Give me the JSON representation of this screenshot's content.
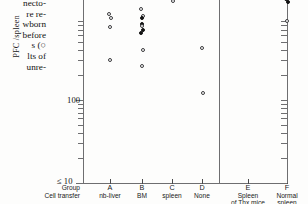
{
  "figure": {
    "caption_fragment_lines": [
      "necto-",
      "re re-",
      "wborn",
      "before",
      "s  (○",
      "lts of",
      "unre-"
    ],
    "y_axis": {
      "label": "PFC /spleen",
      "scale": "log",
      "tick_labels": [
        {
          "text": "100",
          "value": 100
        },
        {
          "text": "10",
          "value": 10
        }
      ],
      "floor_label": "≤ 10"
    },
    "x_axis": {
      "row1_label": "Group",
      "row2_label": "Cell transfer",
      "groups": [
        {
          "letter": "A",
          "name": "nb-liver",
          "sub": ""
        },
        {
          "letter": "B",
          "name": "BM",
          "sub": ""
        },
        {
          "letter": "C",
          "name": "spleen",
          "sub": ""
        },
        {
          "letter": "D",
          "name": "None",
          "sub": ""
        },
        {
          "letter": "E",
          "name": "Spleen",
          "sub": "of Thx mice"
        },
        {
          "letter": "F",
          "name": "Normal",
          "sub": "spleen"
        }
      ]
    },
    "colors": {
      "axis": "#6e6e70",
      "marker_open_stroke": "#3b3b3d",
      "marker_filled": "#141414",
      "background": "#fdfdfc"
    }
  },
  "chart_data": {
    "type": "scatter",
    "title": "",
    "xlabel": "Group / Cell transfer",
    "ylabel": "PFC /spleen",
    "yscale": "log",
    "ylim": [
      10,
      4000
    ],
    "grid": false,
    "legend": [
      "open circle = unresponsive / control",
      "filled circle = responsive"
    ],
    "categories": [
      "A nb-liver",
      "B BM",
      "C spleen",
      "D None",
      "E Spleen of Thx mice",
      "F Normal spleen"
    ],
    "series": [
      {
        "name": "A nb-liver",
        "x": 1,
        "points": [
          {
            "y": 2400,
            "marker": "open"
          },
          {
            "y": 2250,
            "marker": "open"
          },
          {
            "y": 1100,
            "marker": "open"
          },
          {
            "y": 980,
            "marker": "open"
          },
          {
            "y": 760,
            "marker": "open"
          },
          {
            "y": 300,
            "marker": "open"
          }
        ]
      },
      {
        "name": "B BM",
        "x": 2,
        "points": [
          {
            "y": 2500,
            "marker": "filled"
          },
          {
            "y": 2050,
            "marker": "open"
          },
          {
            "y": 1250,
            "marker": "open"
          },
          {
            "y": 1020,
            "marker": "open"
          },
          {
            "y": 980,
            "marker": "filled"
          },
          {
            "y": 830,
            "marker": "filled"
          },
          {
            "y": 780,
            "marker": "open"
          },
          {
            "y": 700,
            "marker": "filled"
          },
          {
            "y": 640,
            "marker": "filled"
          },
          {
            "y": 400,
            "marker": "open"
          },
          {
            "y": 260,
            "marker": "open"
          }
        ]
      },
      {
        "name": "C spleen",
        "x": 3,
        "points": [
          {
            "y": 1850,
            "marker": "open"
          },
          {
            "y": 1550,
            "marker": "open"
          }
        ]
      },
      {
        "name": "D None",
        "x": 4,
        "points": [
          {
            "y": 420,
            "marker": "open"
          },
          {
            "y": 120,
            "marker": "open"
          }
        ]
      },
      {
        "name": "E Spleen of Thx mice",
        "x": 5,
        "points": []
      },
      {
        "name": "F Normal spleen",
        "x": 6,
        "points": [
          {
            "y": 3400,
            "marker": "filled"
          },
          {
            "y": 3250,
            "marker": "open"
          },
          {
            "y": 2600,
            "marker": "open"
          },
          {
            "y": 2300,
            "marker": "open"
          },
          {
            "y": 2150,
            "marker": "filled"
          },
          {
            "y": 2000,
            "marker": "filled"
          },
          {
            "y": 1900,
            "marker": "filled"
          },
          {
            "y": 1750,
            "marker": "open"
          },
          {
            "y": 1650,
            "marker": "filled"
          },
          {
            "y": 1500,
            "marker": "filled"
          },
          {
            "y": 900,
            "marker": "open"
          }
        ]
      }
    ]
  }
}
